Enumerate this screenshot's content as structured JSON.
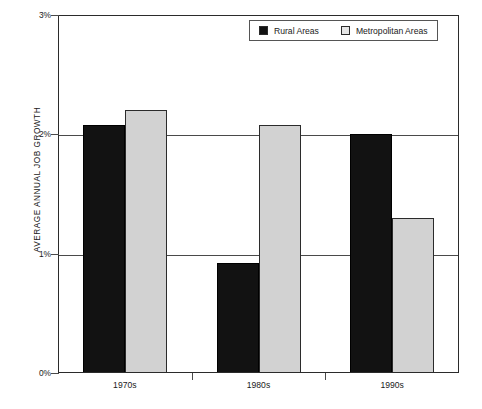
{
  "chart_data": {
    "type": "bar",
    "title": "",
    "xlabel": "",
    "ylabel": "AVERAGE ANNUAL JOB GROWTH",
    "categories": [
      "1970s",
      "1980s",
      "1990s"
    ],
    "series": [
      {
        "name": "Rural Areas",
        "color": "#121212",
        "values": [
          2.08,
          0.92,
          2.0
        ]
      },
      {
        "name": "Metropolitan Areas",
        "color": "#d2d2d2",
        "values": [
          2.2,
          2.08,
          1.3
        ]
      }
    ],
    "ylim": [
      0,
      3
    ],
    "yticks": [
      0,
      1,
      2,
      3
    ],
    "ytick_labels": [
      "0%",
      "1%",
      "2%",
      "3%"
    ],
    "grid": true,
    "legend_position": "top-center"
  },
  "legend": {
    "items": [
      {
        "label": "Rural Areas",
        "swatch": "rural"
      },
      {
        "label": "Metropolitan Areas",
        "swatch": "metro"
      }
    ]
  }
}
